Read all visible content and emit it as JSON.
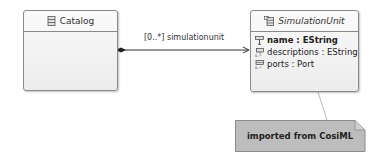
{
  "diagram": {
    "classes": [
      {
        "name": "Catalog",
        "italic": false,
        "icon": "class-icon",
        "attributes": []
      },
      {
        "name": "SimulationUnit",
        "italic": true,
        "icon": "abstract-class-icon",
        "attributes": [
          {
            "label": "name : EString",
            "icon": "id-attribute-icon",
            "bold": true
          },
          {
            "label": "descriptions : EString",
            "icon": "multi-attribute-icon",
            "bold": false
          },
          {
            "label": "ports : Port",
            "icon": "reference-many-icon",
            "bold": false
          }
        ]
      }
    ],
    "association": {
      "label": "[0..*] simulationunit",
      "source": "Catalog",
      "target": "SimulationUnit",
      "source_end": "composition-diamond",
      "target_end": "open-arrow"
    },
    "note": {
      "text": "imported from CosiML",
      "attached_to": "SimulationUnit",
      "fill": "#bdbdbd"
    }
  }
}
